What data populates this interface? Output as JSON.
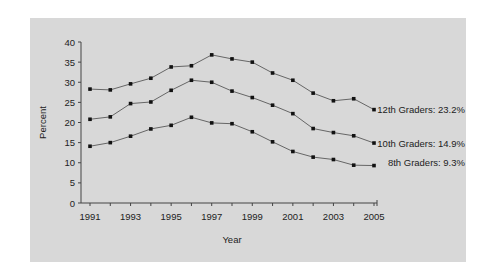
{
  "chart_data": {
    "type": "line",
    "title": "",
    "xlabel": "Year",
    "ylabel": "Percent",
    "ylim": [
      0,
      40
    ],
    "yticks": [
      0,
      5,
      10,
      15,
      20,
      25,
      30,
      35,
      40
    ],
    "xtick_labels": [
      "1991",
      "1993",
      "1995",
      "1997",
      "1999",
      "2001",
      "2003",
      "2005"
    ],
    "x": [
      1991,
      1992,
      1993,
      1994,
      1995,
      1996,
      1997,
      1998,
      1999,
      2000,
      2001,
      2002,
      2003,
      2004,
      2005
    ],
    "grid": false,
    "legend_position": "inline-right",
    "series": [
      {
        "name": "12th Graders",
        "label": "12th Graders: 23.2%",
        "values": [
          28.3,
          28.1,
          29.6,
          31.0,
          33.8,
          34.1,
          36.8,
          35.8,
          35.0,
          32.3,
          30.5,
          27.3,
          25.4,
          25.9,
          23.2
        ]
      },
      {
        "name": "10th Graders",
        "label": "10th Graders: 14.9%",
        "values": [
          20.8,
          21.4,
          24.7,
          25.1,
          28.0,
          30.5,
          30.0,
          27.8,
          26.2,
          24.3,
          22.2,
          18.5,
          17.5,
          16.7,
          14.9
        ]
      },
      {
        "name": "8th Graders",
        "label": "8th Graders: 9.3%",
        "values": [
          14.1,
          15.0,
          16.6,
          18.4,
          19.3,
          21.3,
          19.9,
          19.7,
          17.7,
          15.2,
          12.8,
          11.4,
          10.8,
          9.4,
          9.3
        ]
      }
    ]
  },
  "colors": {
    "background": "#d8d8d8",
    "line": "#666666",
    "marker": "#111111",
    "axis": "#444444"
  }
}
